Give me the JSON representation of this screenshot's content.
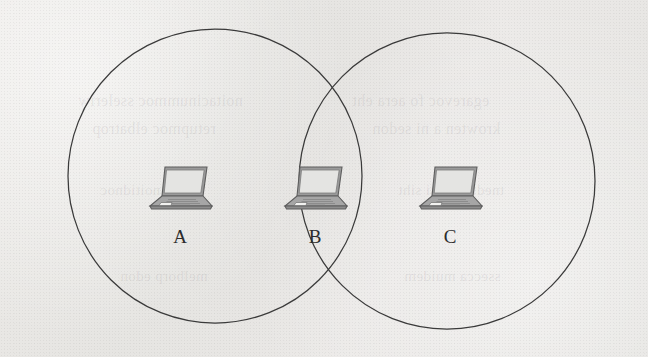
{
  "figure": {
    "type": "venn-coverage-diagram",
    "background_color": "#e8e8e6",
    "stroke_color": "#3a3a3a",
    "circles": [
      {
        "name": "coverage-area-left",
        "cx": 215,
        "cy": 176,
        "r": 147
      },
      {
        "name": "coverage-area-right",
        "cx": 447,
        "cy": 181,
        "r": 148
      }
    ],
    "nodes": [
      {
        "id": "A",
        "label": "A",
        "x": 180,
        "y": 186,
        "label_x": 180,
        "label_y": 236,
        "region": "left-only"
      },
      {
        "id": "B",
        "label": "B",
        "x": 315,
        "y": 186,
        "label_x": 315,
        "label_y": 236,
        "region": "intersection"
      },
      {
        "id": "C",
        "label": "C",
        "x": 450,
        "y": 186,
        "label_x": 450,
        "label_y": 236,
        "region": "right-only"
      }
    ],
    "icon_name": "laptop-icon"
  },
  "bleed_text": [
    {
      "text": "noitacinummoc sseleriw",
      "x": 78,
      "y": 100,
      "size": 16
    },
    {
      "text": "egarevoc fo aera eht",
      "x": 352,
      "y": 100,
      "size": 16
    },
    {
      "text": "retupmoc elbatrop",
      "x": 92,
      "y": 128,
      "size": 16
    },
    {
      "text": "krowten a ni sedon",
      "x": 372,
      "y": 128,
      "size": 16
    },
    {
      "text": "nehw noitidnoc",
      "x": 100,
      "y": 190,
      "size": 15
    },
    {
      "text": "tnedih eht si siht",
      "x": 398,
      "y": 190,
      "size": 15
    },
    {
      "text": "melborp edon",
      "x": 120,
      "y": 276,
      "size": 15
    },
    {
      "text": "ssecca muidem",
      "x": 404,
      "y": 276,
      "size": 15
    }
  ]
}
